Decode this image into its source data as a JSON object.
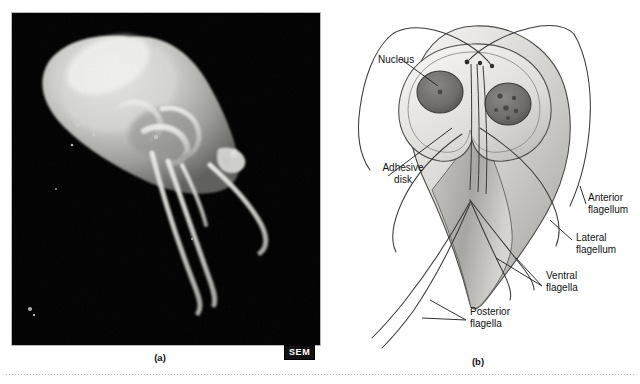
{
  "figure": {
    "type": "two-panel biology figure",
    "organism": "Giardia",
    "background_color": "#ffffff",
    "panels": [
      {
        "id": "a",
        "caption": "(a)",
        "kind": "micrograph",
        "badge": "SEM",
        "badge_bg": "#111111",
        "badge_fg": "#ffffff",
        "background_color": "#000000"
      },
      {
        "id": "b",
        "caption": "(b)",
        "kind": "line-drawing",
        "labels": [
          {
            "name": "nucleus",
            "text": "Nucleus",
            "lines": [
              "Nucleus"
            ]
          },
          {
            "name": "adhesive-disk",
            "text": "Adhesive disk",
            "lines": [
              "Adhesive",
              "disk"
            ]
          },
          {
            "name": "anterior-flagellum",
            "text": "Anterior flagellum",
            "lines": [
              "Anterior",
              "flagellum"
            ]
          },
          {
            "name": "lateral-flagellum",
            "text": "Lateral flagellum",
            "lines": [
              "Lateral",
              "flagellum"
            ]
          },
          {
            "name": "ventral-flagella",
            "text": "Ventral flagella",
            "lines": [
              "Ventral",
              "flagella"
            ]
          },
          {
            "name": "posterior-flagella",
            "text": "Posterior flagella",
            "lines": [
              "Posterior",
              "flagella"
            ]
          }
        ]
      }
    ]
  },
  "labels": {
    "nucleus": "Nucleus",
    "adhesive_disk_line1": "Adhesive",
    "adhesive_disk_line2": "disk",
    "anterior_line1": "Anterior",
    "anterior_line2": "flagellum",
    "lateral_line1": "Lateral",
    "lateral_line2": "flagellum",
    "ventral_line1": "Ventral",
    "ventral_line2": "flagella",
    "posterior_line1": "Posterior",
    "posterior_line2": "flagella"
  },
  "captions": {
    "a": "(a)",
    "b": "(b)"
  },
  "badges": {
    "sem": "SEM"
  },
  "colors": {
    "page_background": "#ffffff",
    "micrograph_background": "#000000",
    "cell_body_light": "#e3e1de",
    "cell_body_mid": "#c9c7c3",
    "cell_body_dark": "#9b9995",
    "nucleus_fill": "#6f6e6c",
    "outline": "#3a3a3a",
    "label_text": "#111111",
    "rule": "#bdbdbd"
  }
}
